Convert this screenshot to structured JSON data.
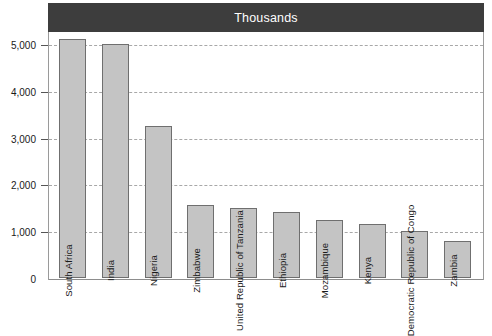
{
  "chart_data": {
    "type": "bar",
    "title": "Thousands",
    "xlabel": "",
    "ylabel": "",
    "ylim": [
      0,
      5600
    ],
    "grid": true,
    "legend": "none",
    "yticks": [
      "0",
      "1,000",
      "2,000",
      "3,000",
      "4,000",
      "5,000"
    ],
    "ytick_values": [
      0,
      1000,
      2000,
      3000,
      4000,
      5000
    ],
    "categories": [
      "South Africa",
      "India",
      "Nigeria",
      "Zimbabwe",
      "United Republic of Tanzania",
      "Ethiopia",
      "Mozambique",
      "Kenya",
      "Democratic Republic of Congo",
      "Zambia"
    ],
    "values": [
      5100,
      5000,
      3250,
      1570,
      1500,
      1400,
      1230,
      1150,
      1010,
      800
    ]
  },
  "colors": {
    "title_bar_background": "#3d3d3d",
    "title_text": "#ffffff",
    "bar_fill": "#c4c4c4",
    "bar_border": "#6f6f6f",
    "gridline": "#a8a8a8",
    "frame": "#9a9a9a",
    "text": "#1a1a1a",
    "page_background": "#ffffff"
  }
}
